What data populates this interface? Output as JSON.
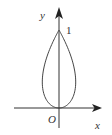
{
  "diagram": {
    "type": "function-curve",
    "axes": {
      "x_label": "x",
      "y_label": "y",
      "origin_label": "O"
    },
    "annotations": {
      "y_tick_label": "1"
    },
    "curve": {
      "bottom_point": [
        0,
        0
      ],
      "top_point": [
        0,
        1
      ],
      "symmetric_about": "y-axis"
    },
    "colors": {
      "stroke": "#333333",
      "background": "#ffffff"
    }
  }
}
